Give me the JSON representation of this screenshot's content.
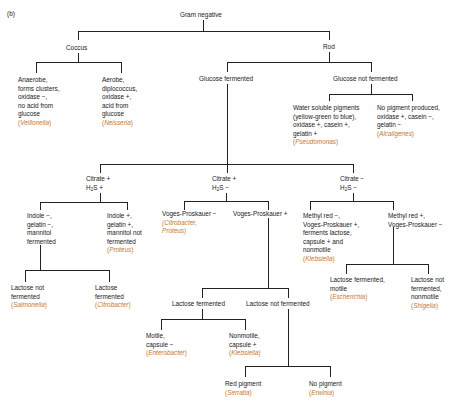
{
  "figure_label": "(b)",
  "accent_color_organism": "#c8762e",
  "line_color": "#222222",
  "root": {
    "lines": [
      "Gram negative"
    ]
  },
  "coccus": {
    "lines": [
      "Coccus"
    ]
  },
  "rod": {
    "lines": [
      "Rod"
    ]
  },
  "anaerobe": {
    "lines": [
      "Anaerobe,",
      "forms clusters,",
      "oxidase −,",
      "no acid from",
      "glucose"
    ],
    "organism": "Veillonella"
  },
  "aerobe": {
    "lines": [
      "Aerobe,",
      "diplococcus,",
      "oxidase +,",
      "acid from",
      "glucose"
    ],
    "organism": "Neisseria"
  },
  "glucose_fermented": {
    "lines": [
      "Glucose fermented"
    ]
  },
  "glucose_not_fermented": {
    "lines": [
      "Glucose not fermented"
    ]
  },
  "water_soluble": {
    "lines": [
      "Water soluble pigments",
      "(yellow-green to blue),",
      "oxidase +, casein +,",
      "gelatin +"
    ],
    "organism": "Pseudomonas"
  },
  "no_pigment_produced": {
    "lines": [
      "No pigment produced,",
      "oxidase +, casein −,",
      "gelatin −"
    ],
    "organism": "Alcaligenes"
  },
  "citrate_pos_h2s_pos": {
    "line1": "Citrate +",
    "h": "H",
    "sub": "2",
    "rest": "S +"
  },
  "citrate_pos_h2s_neg": {
    "line1": "Citrate +",
    "h": "H",
    "sub": "2",
    "rest": "S −"
  },
  "citrate_neg_h2s_neg": {
    "line1": "Citrate −",
    "h": "H",
    "sub": "2",
    "rest": "S −"
  },
  "indole_neg": {
    "lines": [
      "Indole −,",
      "gelatin −,",
      "mannitol",
      "fermented"
    ]
  },
  "indole_pos": {
    "lines": [
      "Indole +,",
      "gelatin +,",
      "mannitol not",
      "fermented"
    ],
    "organism": "Proteus"
  },
  "vp_neg": {
    "lines": [
      "Voges-Proskauer −"
    ],
    "organism_lines": [
      "(Citrobacter,",
      "Proteus)"
    ]
  },
  "vp_pos": {
    "lines": [
      "Voges-Proskauer +"
    ]
  },
  "methyl_red_neg": {
    "lines": [
      "Methyl red −,",
      "Voges-Proskauer +,",
      "ferments lactose,",
      "capsule + and",
      "nonmotile"
    ],
    "organism": "Klebsiella"
  },
  "methyl_red_pos": {
    "lines": [
      "Methyl red +,",
      "Voges-Proskauer −"
    ]
  },
  "salmonella": {
    "lines": [
      "Lactose not",
      "fermented"
    ],
    "organism": "Salmonella"
  },
  "citrobacter": {
    "lines": [
      "Lactose",
      "fermented"
    ],
    "organism": "Citrobacter"
  },
  "lactose_fermented": {
    "lines": [
      "Lactose fermented"
    ]
  },
  "lactose_not_fermented": {
    "lines": [
      "Lactose not fermented"
    ]
  },
  "enterobacter": {
    "lines": [
      "Motile,",
      "capsule −"
    ],
    "organism": "Enterobacter"
  },
  "klebsiella2": {
    "lines": [
      "Nonmotile,",
      "capsule +"
    ],
    "organism": "Klebsiella"
  },
  "escherichia": {
    "lines": [
      "Lactose fermented,",
      "motile"
    ],
    "organism": "Escherichia"
  },
  "shigella": {
    "lines": [
      "Lactose not",
      "fermented,",
      "nonmotile"
    ],
    "organism": "Shigella"
  },
  "serratia": {
    "lines": [
      "Red pigment"
    ],
    "organism": "Serratia"
  },
  "erwinia": {
    "lines": [
      "No pigment"
    ],
    "organism": "Erwinia"
  }
}
